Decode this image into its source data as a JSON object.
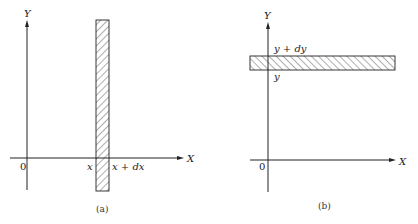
{
  "panels": [
    {
      "id": "a",
      "caption": "(a)",
      "y_axis_label": "Y",
      "x_axis_label": "X",
      "origin_label": "0",
      "strip_orientation": "vertical",
      "strip_lower_label": "x",
      "strip_upper_label": "x + dx"
    },
    {
      "id": "b",
      "caption": "(b)",
      "y_axis_label": "Y",
      "x_axis_label": "X",
      "origin_label": "0",
      "strip_orientation": "horizontal",
      "strip_lower_label": "y",
      "strip_upper_label": "y + dy"
    }
  ],
  "colors": {
    "ink": "#222222",
    "hatch": "#333333"
  }
}
